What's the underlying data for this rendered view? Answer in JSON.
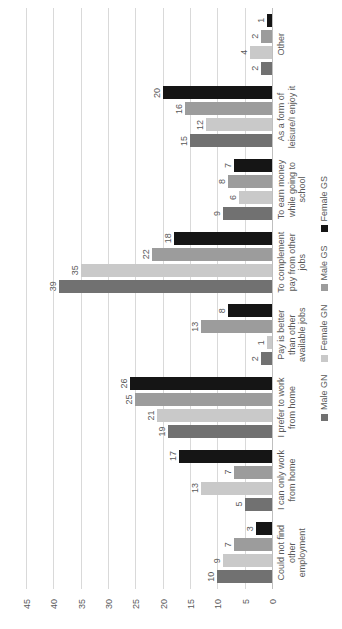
{
  "chart_data": {
    "type": "bar",
    "note_orientation": "column chart rotated 90 degrees counter-clockwise; value axis reads 45..0 along bottom, categories along right edge",
    "title": "",
    "xlabel": "",
    "ylabel": "",
    "grid": true,
    "legend_position": "bottom-of-chart (right edge after rotation)",
    "value_axis": {
      "min": 0,
      "max": 45,
      "step": 5,
      "ticks": [
        0,
        5,
        10,
        15,
        20,
        25,
        30,
        35,
        40,
        45
      ]
    },
    "categories": [
      "Could not find other employment",
      "I can only work from home",
      "I prefer to work from home",
      "Pay is better than other available jobs",
      "To complement pay from other jobs",
      "To earn money while going to school",
      "As a form of leisure/I enjoy it",
      "Other"
    ],
    "category_lines": [
      [
        "Could not find",
        "other",
        "employment"
      ],
      [
        "I can only work",
        "from home"
      ],
      [
        "I prefer to work",
        "from home"
      ],
      [
        "Pay is better",
        "than other",
        "available jobs"
      ],
      [
        "To complement",
        "pay from other",
        "jobs"
      ],
      [
        "To earn money",
        "while going to",
        "school"
      ],
      [
        "As a form of",
        "leisure/I enjoy it"
      ],
      [
        "Other"
      ]
    ],
    "series": [
      {
        "name": "Male GN",
        "color": "#717171",
        "values": [
          10,
          5,
          19,
          2,
          39,
          9,
          15,
          2
        ]
      },
      {
        "name": "Female GN",
        "color": "#c9c9c9",
        "values": [
          9,
          13,
          21,
          1,
          35,
          6,
          12,
          4
        ]
      },
      {
        "name": "Male GS",
        "color": "#9c9c9c",
        "values": [
          7,
          7,
          25,
          13,
          22,
          8,
          16,
          2
        ]
      },
      {
        "name": "Female GS",
        "color": "#151515",
        "values": [
          3,
          17,
          26,
          8,
          18,
          7,
          20,
          1
        ]
      }
    ]
  },
  "colors": {
    "background": "#ffffff",
    "gridline": "#d9d9d9",
    "axis_line": "#bfbfbf",
    "text": "#595959"
  }
}
